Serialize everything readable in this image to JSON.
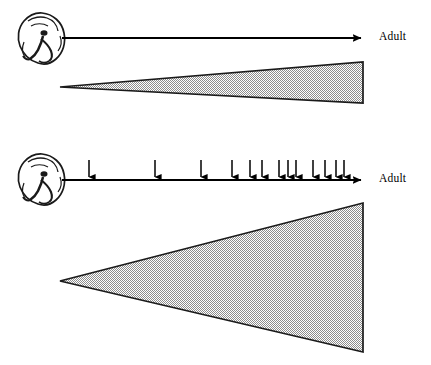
{
  "figure": {
    "title": "",
    "background": "#ffffff",
    "ink": "#000000",
    "stipple_color": "#b9b9b9",
    "width": 431,
    "height": 365
  },
  "panels": [
    {
      "id": "panel-top",
      "name": "unperturbed-development",
      "embryo": {
        "icon": "embryo-icon",
        "x": 16,
        "y": 11,
        "w": 50,
        "h": 50
      },
      "timeline": {
        "name": "developmental-time-axis",
        "x1": 62,
        "y1": 38,
        "x2": 368,
        "y2": 38,
        "arrowhead": "right-arrowhead-icon",
        "end_label": "Adult"
      },
      "perturbations": {
        "count": 0,
        "positions": []
      },
      "variation_wedge": {
        "name": "phenotypic-variation-wedge",
        "apex": [
          60,
          87
        ],
        "top_right": [
          363,
          62
        ],
        "bottom_right": [
          363,
          103
        ],
        "fill": "stipple",
        "stroke": "#000000"
      }
    },
    {
      "id": "panel-bottom",
      "name": "perturbed-development",
      "embryo": {
        "icon": "embryo-icon",
        "x": 16,
        "y": 152,
        "w": 50,
        "h": 50
      },
      "timeline": {
        "name": "developmental-time-axis",
        "x1": 62,
        "y1": 180,
        "x2": 368,
        "y2": 180,
        "arrowhead": "right-arrowhead-icon",
        "end_label": "Adult"
      },
      "perturbations": {
        "name": "perturbation-arrows",
        "icon": "down-arrow-icon",
        "count": 13,
        "tail_y": 160,
        "tip_y": 181,
        "positions": [
          89,
          155,
          201,
          232,
          250,
          262,
          279,
          288,
          296,
          313,
          325,
          336,
          344
        ]
      },
      "variation_wedge": {
        "name": "phenotypic-variation-wedge",
        "apex": [
          60,
          281
        ],
        "top_right": [
          363,
          203
        ],
        "bottom_right": [
          363,
          352
        ],
        "fill": "stipple",
        "stroke": "#000000"
      }
    }
  ],
  "labels": {
    "adult_top": "Adult",
    "adult_bottom": "Adult"
  },
  "chart_data": {
    "type": "diagram",
    "panels": [
      {
        "label": "no perturbations",
        "perturbation_count": 0,
        "wedge_terminal_height": 41
      },
      {
        "label": "perturbations applied",
        "perturbation_count": 13,
        "wedge_terminal_height": 149
      }
    ]
  }
}
